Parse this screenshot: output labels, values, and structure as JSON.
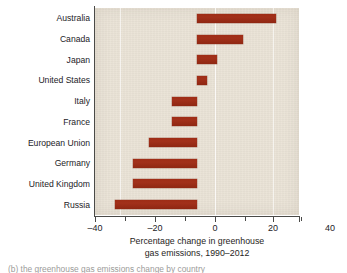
{
  "chart_data": {
    "type": "bar",
    "orientation": "horizontal",
    "title": "",
    "xlabel_line1": "Percentage change in greenhouse",
    "xlabel_line2": "gas emissions, 1990–2012",
    "ylabel": "",
    "categories": [
      "Australia",
      "Canada",
      "Japan",
      "United States",
      "Italy",
      "France",
      "European Union",
      "Germany",
      "United Kingdom",
      "Russia"
    ],
    "values": [
      31,
      18,
      8,
      4,
      -10,
      -10,
      -19,
      -25,
      -25,
      -32
    ],
    "xlim": [
      -40,
      40
    ],
    "xticks": [
      -40,
      -20,
      0,
      20,
      40
    ],
    "xtick_labels": [
      "–40",
      "–20",
      "0",
      "20",
      "40"
    ],
    "minor_xticks": [
      -30,
      -10,
      10,
      30
    ],
    "gridlines": [
      -20,
      0,
      20
    ],
    "grid": true,
    "legend": null,
    "bar_color": "#9a2c15",
    "panel_color": "#e9e2d5",
    "axis_color": "#4a4a48"
  },
  "caption": {
    "partial_text": "(b) the greenhouse gas emissions change by country"
  }
}
